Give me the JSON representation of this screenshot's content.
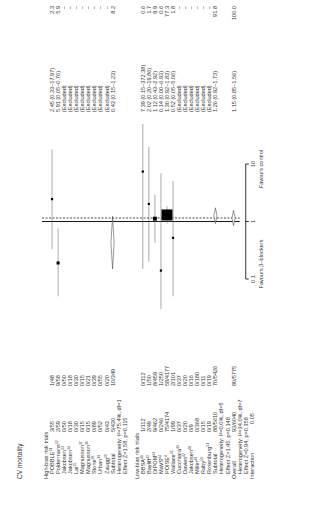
{
  "chart_data": {
    "type": "forest",
    "title": "CV mortality",
    "xscale": "log",
    "xlim": [
      0.1,
      10
    ],
    "x_ticks": [
      "0.1",
      "1",
      "10"
    ],
    "xlabel_left": "Favours β–blockers",
    "xlabel_right": "Favours control",
    "reference_line": 1,
    "overall_dashed_line": 1.15,
    "rows": [
      {
        "kind": "header",
        "label": "High-bias risk trials"
      },
      {
        "kind": "study",
        "label": "POBBLE",
        "ref": "31",
        "bb": "3/55",
        "ctrl": "1/48",
        "or_text": "2.45 (0.33–17.97)",
        "weight": "2.3",
        "or": 2.45,
        "lo": 0.33,
        "hi": 17.97
      },
      {
        "kind": "study",
        "label": "Poldermans",
        "ref": "32",
        "bb": "2/59",
        "ctrl": "9/58",
        "or_text": "5.91 (0.05–0.76)",
        "weight": "5.9",
        "or": 0.19,
        "lo": 0.05,
        "hi": 0.76
      },
      {
        "kind": "study",
        "label": "Jakobsen",
        "ref": "33",
        "bb": "0/50",
        "ctrl": "0/50",
        "or_text": "(Excluded)",
        "weight": "–"
      },
      {
        "kind": "study",
        "label": "Jakobsen",
        "ref": "34",
        "bb": "0/18",
        "ctrl": "0/18",
        "or_text": "(Excluded)",
        "weight": "–"
      },
      {
        "kind": "study",
        "label": "Lai",
        "ref": "35",
        "bb": "0/30",
        "ctrl": "0/30",
        "or_text": "(Excluded)",
        "weight": "–"
      },
      {
        "kind": "study",
        "label": "Magnusson",
        "ref": "37",
        "bb": "0/15",
        "ctrl": "0/15",
        "or_text": "(Excluded)",
        "weight": "–"
      },
      {
        "kind": "study",
        "label": "Magnusson",
        "ref": "36",
        "bb": "0/15",
        "ctrl": "0/21",
        "or_text": "(Excluded)",
        "weight": "–"
      },
      {
        "kind": "study",
        "label": "Stone",
        "ref": "38",
        "bb": "0/89",
        "ctrl": "0/39",
        "or_text": "(Excluded)",
        "weight": "–"
      },
      {
        "kind": "study",
        "label": "Urban",
        "ref": "39",
        "bb": "0/52",
        "ctrl": "0/55",
        "or_text": "(Excluded)",
        "weight": "–"
      },
      {
        "kind": "study",
        "label": "Zaugg",
        "ref": "40",
        "bb": "0/43",
        "ctrl": "0/20",
        "or_text": "(Excluded)",
        "weight": "–"
      },
      {
        "kind": "subtotal",
        "label": "Subtotal",
        "bb": "5/430",
        "ctrl": "10/349",
        "or_text": "0.43 (0.15–1.23)",
        "weight": "8.2",
        "or": 0.43,
        "lo": 0.15,
        "hi": 1.23
      },
      {
        "kind": "note",
        "label": "Heterogeneity: I²=75.4%, df=1"
      },
      {
        "kind": "note",
        "label": "Effect Z=1.58, p=0.115"
      },
      {
        "kind": "spacer"
      },
      {
        "kind": "header",
        "label": "Low-bias risk trials"
      },
      {
        "kind": "study",
        "label": "BBSA",
        "ref": "41",
        "bb": "1/112",
        "ctrl": "0/112",
        "or_text": "7.39 (0.15–372.38)",
        "weight": "0.6",
        "or": 7.39,
        "lo": 0.15,
        "hi": 372.38
      },
      {
        "kind": "study",
        "label": "Bayliff",
        "ref": "42",
        "bb": "2/49",
        "ctrl": "1/50",
        "or_text": "2.02 (0.20–19.86)",
        "weight": "1.7",
        "or": 2.02,
        "lo": 0.2,
        "hi": 19.86
      },
      {
        "kind": "study",
        "label": "DIPOM",
        "ref": "43",
        "bb": "9/462",
        "ctrl": "8/459",
        "or_text": "1.12 (0.43–2.92)",
        "weight": "9.9",
        "or": 1.12,
        "lo": 0.43,
        "hi": 2.92
      },
      {
        "kind": "study",
        "label": "MaVS",
        "ref": "44",
        "bb": "0/246",
        "ctrl": "1/250",
        "or_text": "0.14 (0.00–6.93)",
        "weight": "0.6",
        "or": 0.14,
        "lo": 0.003,
        "hi": 6.93
      },
      {
        "kind": "study",
        "label": "POISE",
        "ref": "4",
        "bb": "75/4174",
        "ctrl": "58/4177",
        "or_text": "1.30 (0.92–1.83)",
        "weight": "77.3",
        "or": 1.3,
        "lo": 0.92,
        "hi": 1.83
      },
      {
        "kind": "study",
        "label": "Wallace",
        "ref": "45",
        "bb": "1/99",
        "ctrl": "2/101",
        "or_text": "0.52 (0.05–5.06)",
        "weight": "1.8",
        "or": 0.52,
        "lo": 0.05,
        "hi": 5.06
      },
      {
        "kind": "study",
        "label": "Cucchiara",
        "ref": "46",
        "bb": "0/37",
        "ctrl": "0/37",
        "or_text": "(Excluded)",
        "weight": "–"
      },
      {
        "kind": "study",
        "label": "Davies",
        "ref": "47",
        "bb": "0/20",
        "ctrl": "0/20",
        "or_text": "(Excluded)",
        "weight": "–"
      },
      {
        "kind": "study",
        "label": "Jakobsen",
        "ref": "48",
        "bb": "0/9",
        "ctrl": "0/16",
        "or_text": "(Excluded)",
        "weight": "–"
      },
      {
        "kind": "study",
        "label": "Miller",
        "ref": "49",
        "bb": "0/368",
        "ctrl": "0/180",
        "or_text": "(Excluded)",
        "weight": "–"
      },
      {
        "kind": "study",
        "label": "Raby",
        "ref": "50",
        "bb": "0/15",
        "ctrl": "0/11",
        "or_text": "(Excluded)",
        "weight": "–"
      },
      {
        "kind": "study",
        "label": "Rosenburg",
        "ref": "51",
        "bb": "0/19",
        "ctrl": "0/19",
        "or_text": "(Excluded)",
        "weight": "–"
      },
      {
        "kind": "subtotal",
        "label": "Subtotal",
        "bb": "88/5610",
        "ctrl": "70/5426",
        "or_text": "1.26 (0.92–1.73)",
        "weight": "91.8",
        "or": 1.26,
        "lo": 0.92,
        "hi": 1.73
      },
      {
        "kind": "note",
        "label": "Heterogeneity: I²=0.0%, df=5"
      },
      {
        "kind": "note",
        "label": "Effect Z=1.45, p=0.148"
      },
      {
        "kind": "overall",
        "label": "Overall",
        "bb": "93/6040",
        "ctrl": "80/5775",
        "or_text": "1.15 (0.85–1.56)",
        "weight": "100.0",
        "or": 1.15,
        "lo": 0.85,
        "hi": 1.56
      },
      {
        "kind": "note",
        "label": "Heterogeneity: I²=34.0%, df=7"
      },
      {
        "kind": "note",
        "label": "Effect Z=0.94, p=0.358"
      },
      {
        "kind": "interaction",
        "label": "Interaction",
        "bb": "0.05"
      }
    ]
  }
}
